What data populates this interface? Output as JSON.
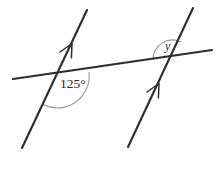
{
  "figure": {
    "background_color": "#ffffff",
    "line_color": "#2b2b2b",
    "arc_color": "#9a9a9a",
    "text_color": "#242424"
  },
  "labels": {
    "angle_known": "125°",
    "angle_unknown": "y"
  },
  "geometry": {
    "transversal": {
      "x1": 13,
      "y1": 79,
      "x2": 212,
      "y2": 50
    },
    "parallel_left": {
      "x1": 87,
      "y1": 10,
      "x2": 22,
      "y2": 148
    },
    "parallel_right": {
      "x1": 193,
      "y1": 8,
      "x2": 128,
      "y2": 147
    },
    "intersection_left": {
      "x": 57,
      "y": 77
    },
    "intersection_right": {
      "x": 172,
      "y": 57
    },
    "arrow_left": {
      "x": 70,
      "y": 47
    },
    "arrow_right": {
      "x": 157,
      "y": 87
    }
  }
}
